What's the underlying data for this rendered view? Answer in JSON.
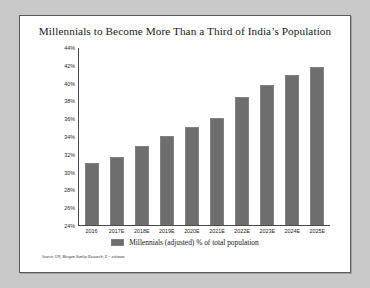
{
  "chart_data": {
    "type": "bar",
    "title": "Millennials to Become More Than a Third of India’s Population",
    "xlabel": "",
    "ylabel": "",
    "ylim": [
      24,
      44
    ],
    "ytick_step": 2,
    "grid": false,
    "legend_position": "bottom",
    "categories": [
      "2016",
      "2017E",
      "2018E",
      "2019E",
      "2020E",
      "2021E",
      "2022E",
      "2023E",
      "2024E",
      "2025E"
    ],
    "values": [
      31.0,
      31.7,
      32.9,
      34.1,
      35.1,
      36.1,
      38.5,
      39.8,
      41.0,
      41.8
    ],
    "ytick_labels": [
      "44%",
      "42%",
      "40%",
      "38%",
      "36%",
      "34%",
      "32%",
      "30%",
      "28%",
      "26%",
      "24%"
    ],
    "series": [
      {
        "name": "Millennials (adjusted) % of total population",
        "color": "#6e6e6e",
        "values": [
          31.0,
          31.7,
          32.9,
          34.1,
          35.1,
          36.1,
          38.5,
          39.8,
          41.0,
          41.8
        ]
      }
    ],
    "legend": [
      "Millennials (adjusted) % of total population"
    ],
    "source_note": "Source: UN, Morgan Stanley Research; E = estimate"
  }
}
